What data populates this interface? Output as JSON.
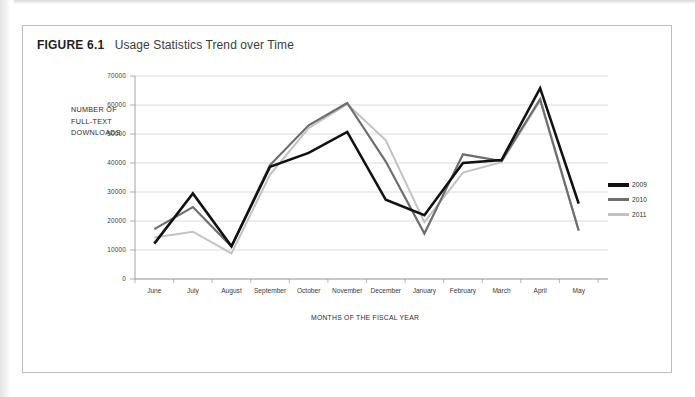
{
  "figure": {
    "label": "FIGURE 6.1",
    "title": "Usage Statistics Trend over Time"
  },
  "colors": {
    "series_2009": "#111111",
    "series_2010": "#6e6e6e",
    "series_2011": "#c2c2c2",
    "gridline": "#d2d2d2",
    "axis": "#9a9a9a",
    "text": "#2b2b2b",
    "frame": "#bdbdbd"
  },
  "legend": {
    "position": "right",
    "entries": [
      {
        "label": "2009",
        "color": "#111111",
        "swatch": "line-swatch-2009"
      },
      {
        "label": "2010",
        "color": "#6e6e6e",
        "swatch": "line-swatch-2010"
      },
      {
        "label": "2011",
        "color": "#c2c2c2",
        "swatch": "line-swatch-2011"
      }
    ]
  },
  "axes": {
    "y_note_line1": "NUMBER OF",
    "y_note_line2": "FULL-TEXT",
    "y_note_line3": "DOWNLOADS",
    "y_note_full": "NUMBER OF FULL-TEXT DOWNLOADS",
    "x_title": "MONTHS OF THE FISCAL YEAR",
    "y_ticks": [
      "0",
      "10000",
      "20000",
      "30000",
      "40000",
      "50000",
      "60000",
      "70000"
    ]
  },
  "chart_data": {
    "type": "line",
    "title": "Usage Statistics Trend over Time",
    "xlabel": "MONTHS OF THE FISCAL YEAR",
    "ylabel": "NUMBER OF FULL-TEXT DOWNLOADS",
    "ylim": [
      0,
      70000
    ],
    "ytick_step": 10000,
    "grid": true,
    "legend_position": "right",
    "categories": [
      "June",
      "July",
      "August",
      "September",
      "October",
      "November",
      "December",
      "January",
      "February",
      "March",
      "April",
      "May"
    ],
    "series": [
      {
        "name": "2009",
        "color": "#111111",
        "values": [
          12200,
          29500,
          11300,
          38700,
          43500,
          50700,
          27300,
          22000,
          40000,
          41000,
          65800,
          26000
        ]
      },
      {
        "name": "2010",
        "color": "#6e6e6e",
        "values": [
          17200,
          24800,
          11200,
          39300,
          53000,
          60700,
          40500,
          15700,
          43000,
          40700,
          62000,
          16700
        ]
      },
      {
        "name": "2011",
        "color": "#c2c2c2",
        "values": [
          14300,
          16300,
          8800,
          36000,
          52000,
          60300,
          47800,
          19600,
          36700,
          40300,
          61500,
          16700
        ]
      }
    ]
  }
}
